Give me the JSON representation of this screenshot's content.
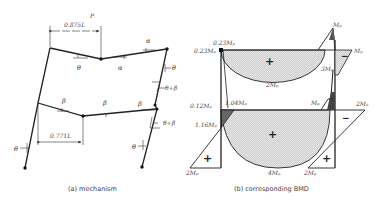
{
  "figure": {
    "panel_a": {
      "caption": "(a) mechanism",
      "load_label": "P",
      "dims": {
        "top": "0.875L",
        "bottom": "0.771L"
      },
      "angle_labels": {
        "theta": "θ",
        "alpha": "α",
        "beta": "β",
        "theta_plus_beta": "θ+β"
      }
    },
    "panel_b": {
      "caption": "(b) corresponding BMD",
      "labels": {
        "top_left_upper": "0.23Mₚ",
        "top_left": "0.23Mₚ",
        "top_right_peak": "Mₚ",
        "top_right_side": "Mₚ",
        "upper_sag": "2Mₚ",
        "upper_right_col": "3Mₚ",
        "lower_left_a": "0.12Mₚ",
        "lower_left_b": "1.04Mₚ",
        "lower_left_c": "1.16Mₚ",
        "lower_right_inner": "Mₚ",
        "lower_right_outer": "2Mₚ",
        "lower_sag": "4Mₚ",
        "base_left": "2Mₚ",
        "base_right": "2Mₚ"
      },
      "signs": {
        "plus": "+",
        "minus": "−"
      }
    }
  }
}
